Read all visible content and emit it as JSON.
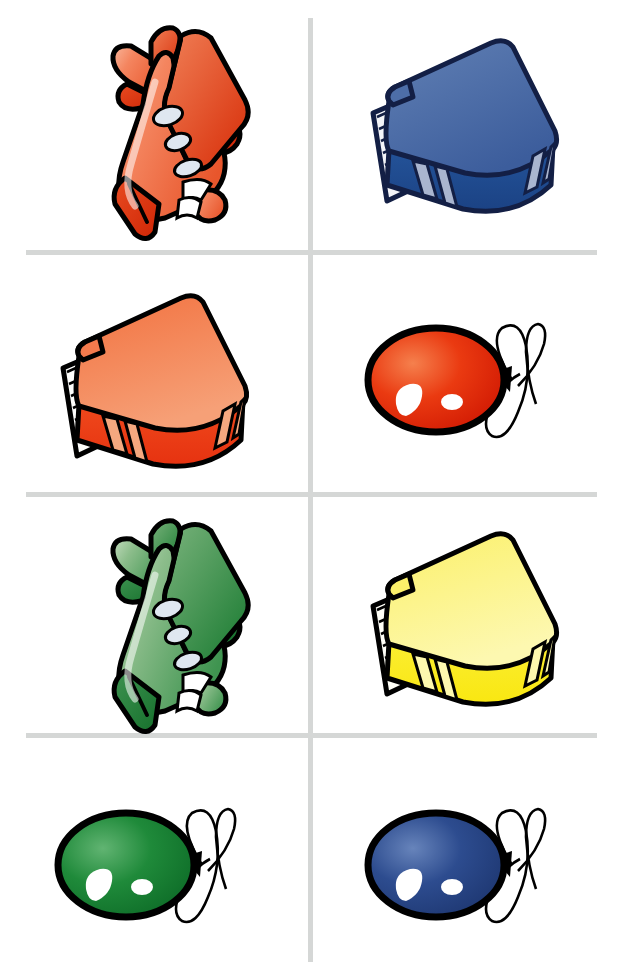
{
  "page": {
    "width": 621,
    "height": 980,
    "background": "#ffffff",
    "kind": "picture-grid",
    "columns": 2,
    "rows": 4
  },
  "grid": {
    "line_color": "#d5d7d6",
    "line_thickness": 5,
    "vertical_lines": [
      {
        "x": 308,
        "y_start": 18,
        "y_end": 962
      }
    ],
    "horizontal_lines": [
      {
        "y": 250,
        "x_start": 26,
        "x_end": 597
      },
      {
        "y": 492,
        "x_start": 26,
        "x_end": 597
      },
      {
        "y": 733,
        "x_start": 26,
        "x_end": 597
      }
    ]
  },
  "palette": {
    "outline": "#000000",
    "airplane_orange_light": "#f6a183",
    "airplane_orange": "#ef6a43",
    "airplane_orange_dark": "#e23b15",
    "airplane_green_light": "#aed4aa",
    "airplane_green": "#5fa665",
    "airplane_green_dark": "#1d8034",
    "book_blue_top": "#4f6fa8",
    "book_blue_side": "#1f4d8f",
    "book_blue_outline": "#15224a",
    "book_blue_band": "#a9b5cf",
    "book_red_top": "#f4845c",
    "book_red_side": "#ec3b16",
    "book_red_band": "#f1a277",
    "book_yellow_top": "#fbf47e",
    "book_yellow_side": "#fbec28",
    "book_yellow_band": "#fdf7a6",
    "balloon_red": "#e8240c",
    "balloon_red_light": "#f4703a",
    "balloon_green": "#1d8034",
    "balloon_green_light": "#59ae6a",
    "balloon_blue": "#2c4a8c",
    "balloon_blue_light": "#5f7cb5",
    "highlight": "#ffffff",
    "window": "#dfe7f0"
  },
  "cells": [
    {
      "id": "cell-r1c1",
      "row": 1,
      "column": 1,
      "object": "airplane",
      "color_name": "orange",
      "color_hex": "#ef6a43",
      "label": "orange-airplane",
      "x": 55,
      "y": 15,
      "w": 200,
      "h": 220
    },
    {
      "id": "cell-r1c2",
      "row": 1,
      "column": 2,
      "object": "book",
      "color_name": "blue",
      "color_hex": "#1f4d8f",
      "label": "blue-book",
      "x": 370,
      "y": 40,
      "w": 200,
      "h": 170
    },
    {
      "id": "cell-r2c1",
      "row": 2,
      "column": 1,
      "object": "book",
      "color_name": "red",
      "color_hex": "#ec3b16",
      "label": "red-book",
      "x": 60,
      "y": 295,
      "w": 200,
      "h": 170
    },
    {
      "id": "cell-r2c2",
      "row": 2,
      "column": 2,
      "object": "balloon",
      "color_name": "red",
      "color_hex": "#e8240c",
      "label": "red-balloon",
      "x": 365,
      "y": 310,
      "w": 195,
      "h": 145
    },
    {
      "id": "cell-r3c1",
      "row": 3,
      "column": 1,
      "object": "airplane",
      "color_name": "green",
      "color_hex": "#5fa665",
      "label": "green-airplane",
      "x": 55,
      "y": 510,
      "w": 200,
      "h": 220
    },
    {
      "id": "cell-r3c2",
      "row": 3,
      "column": 2,
      "object": "book",
      "color_name": "yellow",
      "color_hex": "#fbec28",
      "label": "yellow-book",
      "x": 370,
      "y": 535,
      "w": 200,
      "h": 170
    },
    {
      "id": "cell-r4c1",
      "row": 4,
      "column": 1,
      "object": "balloon",
      "color_name": "green",
      "color_hex": "#1d8034",
      "label": "green-balloon",
      "x": 55,
      "y": 795,
      "w": 195,
      "h": 145
    },
    {
      "id": "cell-r4c2",
      "row": 4,
      "column": 2,
      "object": "balloon",
      "color_name": "blue",
      "color_hex": "#2c4a8c",
      "label": "blue-balloon",
      "x": 365,
      "y": 795,
      "w": 195,
      "h": 145
    }
  ]
}
